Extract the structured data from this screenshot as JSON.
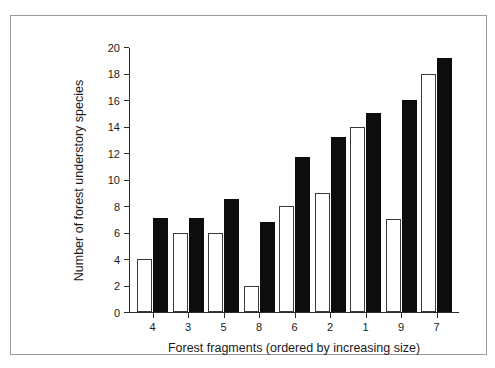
{
  "chart_data": {
    "type": "bar",
    "title": "",
    "xlabel": "Forest fragments (ordered by increasing size)",
    "ylabel": "Number of forest understory species",
    "categories": [
      "4",
      "3",
      "5",
      "8",
      "6",
      "2",
      "1",
      "9",
      "7"
    ],
    "ylim": [
      0,
      20
    ],
    "ytick_step": 2,
    "yticks": [
      "20",
      "18",
      "16",
      "14",
      "12",
      "10",
      "8",
      "6",
      "4",
      "2",
      "0"
    ],
    "grid": false,
    "legend": "none",
    "series": [
      {
        "name": "open-bar",
        "style": "open",
        "color": "#ffffff",
        "edge_color": "#3a3a3a",
        "values": [
          4.0,
          6.0,
          6.0,
          2.0,
          8.0,
          9.0,
          14.0,
          7.0,
          18.0
        ]
      },
      {
        "name": "filled-bar",
        "style": "filled",
        "color": "#0d0d0d",
        "edge_color": "#0d0d0d",
        "values": [
          7.1,
          7.1,
          8.5,
          6.8,
          11.7,
          13.2,
          15.0,
          16.0,
          19.2
        ]
      }
    ]
  },
  "figure": {
    "frame_color": "#9b9b9b",
    "axis_color": "#2b2b2b",
    "background": "#ffffff"
  }
}
